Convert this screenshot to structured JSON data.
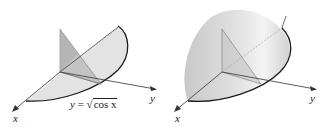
{
  "figures": [
    {
      "id": "left",
      "description": "Cross-sectional triangle slab over region under y = sqrt(cos x)",
      "axes": {
        "x_label": "x",
        "y_label": "y"
      },
      "curve_label": {
        "lhs": "y",
        "eq": "=",
        "radicand": "cos x",
        "radicand_var": "x",
        "radicand_fn": "cos"
      }
    },
    {
      "id": "right",
      "description": "Solid with triangular cross-sections",
      "axes": {
        "x_label": "x",
        "y_label": "y"
      }
    }
  ],
  "colors": {
    "fill_light": "#e6e6e6",
    "fill_mid": "#cfcfcf",
    "fill_dark": "#b8b8b8",
    "curve": "#1a1a1a",
    "axis": "#333333"
  }
}
